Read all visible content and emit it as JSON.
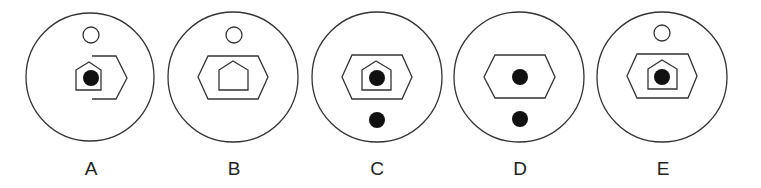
{
  "options": [
    {
      "label": "A",
      "elements": [
        "small-open-circle-top",
        "pentagon-with-dot",
        "partial-hexagon-right"
      ]
    },
    {
      "label": "B",
      "elements": [
        "small-open-circle-top",
        "hexagon",
        "empty-pentagon"
      ]
    },
    {
      "label": "C",
      "elements": [
        "hexagon",
        "pentagon-with-dot",
        "filled-dot-bottom"
      ]
    },
    {
      "label": "D",
      "elements": [
        "hexagon",
        "filled-dot-center",
        "filled-dot-bottom"
      ]
    },
    {
      "label": "E",
      "elements": [
        "small-open-circle-top",
        "hexagon",
        "pentagon-with-dot"
      ]
    }
  ],
  "colors": {
    "stroke": "#333333",
    "fill_dot": "#111111",
    "background": "#ffffff"
  }
}
